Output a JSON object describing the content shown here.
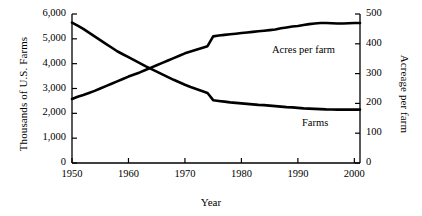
{
  "chart_data": {
    "type": "line",
    "title": "",
    "xlabel": "Year",
    "ylabel": "Thousands of U.S. Farms",
    "y2label": "Acreage per farm",
    "xlim": [
      1950,
      2001
    ],
    "ylim": [
      0,
      6000
    ],
    "y2lim": [
      0,
      500
    ],
    "grid": false,
    "legend_position": "inline-annotations",
    "xticks": [
      "1950",
      "1960",
      "1970",
      "1980",
      "1990",
      "2000"
    ],
    "xtick_values": [
      1950,
      1960,
      1970,
      1980,
      1990,
      2000
    ],
    "yticks": [
      "0",
      "1,000",
      "2,000",
      "3,000",
      "4,000",
      "5,000",
      "6,000"
    ],
    "ytick_values": [
      0,
      1000,
      2000,
      3000,
      4000,
      5000,
      6000
    ],
    "y2ticks": [
      "0",
      "100",
      "200",
      "300",
      "400",
      "500"
    ],
    "y2tick_values": [
      0,
      100,
      200,
      300,
      400,
      500
    ],
    "annotations": [
      {
        "text": "Acres per farm",
        "series": "acres_per_farm"
      },
      {
        "text": "Farms",
        "series": "farms"
      }
    ],
    "x": [
      1950,
      1951,
      1952,
      1953,
      1954,
      1955,
      1956,
      1957,
      1958,
      1959,
      1960,
      1961,
      1962,
      1963,
      1964,
      1965,
      1966,
      1967,
      1968,
      1969,
      1970,
      1971,
      1972,
      1973,
      1974,
      1975,
      1976,
      1977,
      1978,
      1979,
      1980,
      1981,
      1982,
      1983,
      1984,
      1985,
      1986,
      1987,
      1988,
      1989,
      1990,
      1991,
      1992,
      1993,
      1994,
      1995,
      1996,
      1997,
      1998,
      1999,
      2000,
      2001
    ],
    "series": [
      {
        "name": "Farms",
        "axis": "left",
        "units": "thousands of U.S. farms",
        "values": [
          5650,
          5530,
          5400,
          5250,
          5100,
          4950,
          4800,
          4650,
          4500,
          4380,
          4260,
          4140,
          4020,
          3900,
          3790,
          3680,
          3570,
          3460,
          3350,
          3250,
          3150,
          3060,
          2980,
          2900,
          2820,
          2530,
          2500,
          2470,
          2440,
          2420,
          2400,
          2380,
          2360,
          2340,
          2330,
          2310,
          2290,
          2270,
          2250,
          2240,
          2220,
          2200,
          2190,
          2180,
          2170,
          2160,
          2155,
          2150,
          2150,
          2150,
          2150,
          2150
        ]
      },
      {
        "name": "Acres per farm",
        "axis": "right",
        "units": "acres per farm",
        "values": [
          215,
          222,
          228,
          235,
          242,
          250,
          258,
          266,
          274,
          282,
          290,
          297,
          304,
          312,
          320,
          328,
          336,
          344,
          352,
          360,
          368,
          374,
          380,
          386,
          392,
          425,
          428,
          430,
          432,
          434,
          436,
          438,
          440,
          442,
          444,
          446,
          448,
          452,
          455,
          458,
          460,
          463,
          466,
          468,
          470,
          470,
          469,
          468,
          468,
          469,
          470,
          470
        ]
      }
    ]
  }
}
